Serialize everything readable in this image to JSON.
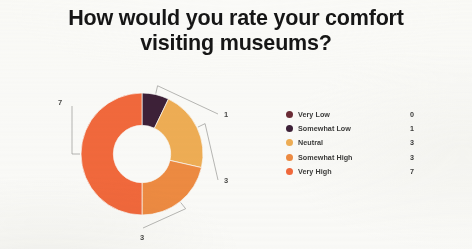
{
  "slide": {
    "background_color": "#fbfbf9",
    "title_line_1": "How would you rate your comfort",
    "title_line_2": "visiting museums?",
    "title_color": "#161616"
  },
  "legend": {
    "position": "right",
    "rows": [
      {
        "label": "Very Low",
        "value": "0",
        "color": "#6B2B35"
      },
      {
        "label": "Somewhat Low",
        "value": "1",
        "color": "#3D2138"
      },
      {
        "label": "Neutral",
        "value": "3",
        "color": "#EFAE55"
      },
      {
        "label": "Somewhat High",
        "value": "3",
        "color": "#EE8B42"
      },
      {
        "label": "Very High",
        "value": "7",
        "color": "#F2693C"
      }
    ]
  },
  "slice_labels": [
    {
      "name": "label-somewhat-low",
      "text": "1"
    },
    {
      "name": "label-neutral",
      "text": "3"
    },
    {
      "name": "label-somewhat-high",
      "text": "3"
    },
    {
      "name": "label-very-high",
      "text": "7"
    }
  ],
  "chart_data": {
    "type": "pie",
    "variant": "donut",
    "title": "How would you rate your comfort visiting museums?",
    "xlabel": "",
    "ylabel": "",
    "grid": false,
    "legend_position": "right",
    "total": 14,
    "inner_radius_ratio": 0.47,
    "start_angle_deg": 0,
    "direction": "clockwise",
    "categories": [
      "Very Low",
      "Somewhat Low",
      "Neutral",
      "Somewhat High",
      "Very High"
    ],
    "values": [
      0,
      1,
      3,
      3,
      7
    ],
    "colors": [
      "#6B2B35",
      "#3D2138",
      "#EFAE55",
      "#EE8B42",
      "#F2693C"
    ],
    "slices": [
      {
        "label": "Very Low",
        "value": 0,
        "percent": 0.0,
        "color": "#6B2B35",
        "angle_deg": 0,
        "rendered": false,
        "data_label": ""
      },
      {
        "label": "Somewhat Low",
        "value": 1,
        "percent": 7.1,
        "color": "#3D2138",
        "angle_deg": 25.7,
        "rendered": true,
        "data_label": "1"
      },
      {
        "label": "Neutral",
        "value": 3,
        "percent": 21.4,
        "color": "#EFAE55",
        "angle_deg": 77.1,
        "rendered": true,
        "data_label": "3"
      },
      {
        "label": "Somewhat High",
        "value": 3,
        "percent": 21.4,
        "color": "#EE8B42",
        "angle_deg": 77.1,
        "rendered": true,
        "data_label": "3"
      },
      {
        "label": "Very High",
        "value": 7,
        "percent": 50.0,
        "color": "#F2693C",
        "angle_deg": 180.0,
        "rendered": true,
        "data_label": "7"
      }
    ]
  }
}
